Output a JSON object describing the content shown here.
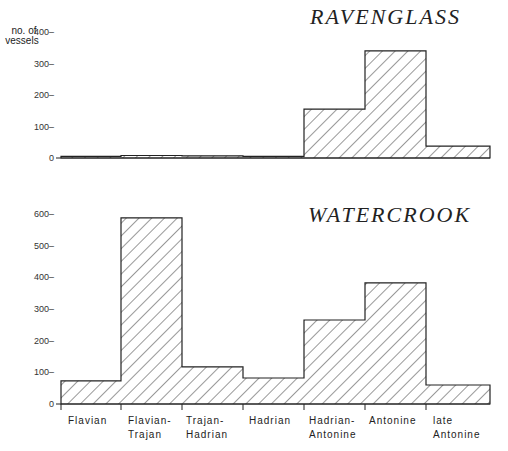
{
  "chart_data": [
    {
      "type": "bar",
      "title": "RAVENGLASS",
      "xlabel": "",
      "ylabel": "no. of vessels",
      "categories": [
        "Flavian",
        "Flavian-Trajan",
        "Trajan-Hadrian",
        "Hadrian",
        "Hadrian-Antonine",
        "Antonine",
        "late Antonine"
      ],
      "values": [
        5,
        8,
        7,
        5,
        155,
        340,
        38
      ],
      "yticks": [
        0,
        100,
        200,
        300,
        400
      ],
      "ylim": [
        0,
        400
      ],
      "grid": false,
      "style": "histogram, diagonal hatching"
    },
    {
      "type": "bar",
      "title": "WATERCROOK",
      "xlabel": "",
      "ylabel": "",
      "categories": [
        "Flavian",
        "Flavian-Trajan",
        "Trajan-Hadrian",
        "Hadrian",
        "Hadrian-Antonine",
        "Antonine",
        "late Antonine"
      ],
      "values": [
        73,
        587,
        117,
        82,
        265,
        382,
        60
      ],
      "yticks": [
        0,
        100,
        200,
        300,
        400,
        500,
        600
      ],
      "ylim": [
        0,
        600
      ],
      "grid": false,
      "style": "histogram, diagonal hatching"
    }
  ],
  "labels": {
    "ylabel_line1": "no. of",
    "ylabel_line2": "vessels",
    "ravenglass_title": "RAVENGLASS",
    "watercrook_title": "WATERCROOK",
    "categories_line1": [
      "Flavian",
      "Flavian-",
      "Trajan-",
      "Hadrian",
      "Hadrian-",
      "Antonine",
      "late"
    ],
    "categories_line2": [
      "",
      "Trajan",
      "Hadrian",
      "",
      "Antonine",
      "",
      "Antonine"
    ]
  },
  "colors": {
    "ink": "#222222",
    "background": "#ffffff"
  }
}
